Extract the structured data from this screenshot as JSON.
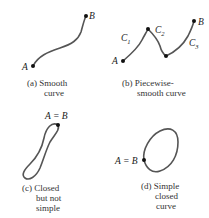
{
  "panels": [
    {
      "id": "a",
      "points": [
        "A",
        "B"
      ],
      "caption_lines": [
        "(a) Smooth",
        "curve"
      ]
    },
    {
      "id": "b",
      "points": [
        "A",
        "B"
      ],
      "segments": [
        {
          "name": "C",
          "sub": "1"
        },
        {
          "name": "C",
          "sub": "2"
        },
        {
          "name": "C",
          "sub": "3"
        }
      ],
      "caption_lines": [
        "(b) Piecewise-",
        "smooth curve"
      ]
    },
    {
      "id": "c",
      "point_label": "A = B",
      "caption_lines": [
        "(c) Closed",
        "but not",
        "simple"
      ]
    },
    {
      "id": "d",
      "point_label": "A = B",
      "caption_lines": [
        "(d) Simple",
        "closed",
        "curve"
      ]
    }
  ]
}
